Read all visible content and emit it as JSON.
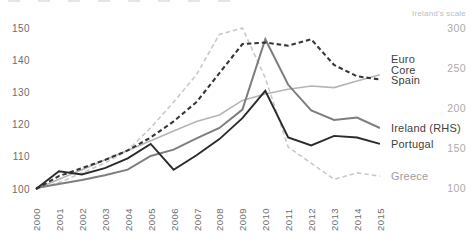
{
  "chart_data": {
    "type": "line",
    "title": "",
    "grid": false,
    "legend_position": "right",
    "x": [
      2000,
      2001,
      2002,
      2003,
      2004,
      2005,
      2006,
      2007,
      2008,
      2009,
      2010,
      2011,
      2012,
      2013,
      2014,
      2015
    ],
    "left_axis": {
      "ticks": [
        150,
        140,
        130,
        120,
        110,
        100
      ],
      "range": [
        100,
        150
      ]
    },
    "right_axis": {
      "title": "Ireland's scale",
      "ticks": [
        300,
        250,
        200,
        150,
        100
      ],
      "range": [
        100,
        300
      ]
    },
    "series": [
      {
        "name": "Euro Core",
        "label_lines": [
          "Euro",
          "Core"
        ],
        "axis": "left",
        "style": "solid",
        "color": "#b5b5b5",
        "label_color": "#3f3f3f",
        "width": 1.6,
        "values": [
          100,
          103,
          106,
          109,
          112,
          115,
          118,
          121,
          123,
          127.5,
          129.5,
          131,
          132,
          131.5,
          133.5,
          135.5
        ]
      },
      {
        "name": "Greece",
        "axis": "left",
        "style": "dashed",
        "color": "#c9c9c9",
        "label_color": "#9e9e9e",
        "width": 1.6,
        "values": [
          100,
          102,
          105,
          108,
          112,
          119,
          127,
          135.5,
          148,
          150,
          134.5,
          113,
          108,
          103,
          105,
          104
        ]
      },
      {
        "name": "Ireland (RHS)",
        "axis": "right",
        "style": "solid",
        "color": "#7e7e7e",
        "label_color": "#3f3f3f",
        "width": 2,
        "values": [
          100,
          105,
          110,
          116,
          123,
          140,
          148,
          162,
          175,
          198,
          286,
          229,
          197,
          185,
          188,
          175
        ]
      },
      {
        "name": "Spain",
        "axis": "left",
        "style": "dashed",
        "color": "#363636",
        "label_color": "#3f3f3f",
        "width": 2.1,
        "values": [
          100,
          104,
          106.5,
          109,
          112,
          116,
          121,
          127,
          136,
          145,
          145.5,
          144.5,
          146.5,
          138.5,
          135,
          134
        ]
      },
      {
        "name": "Portugal",
        "axis": "left",
        "style": "solid",
        "color": "#2b2b2b",
        "label_color": "#3f3f3f",
        "width": 1.9,
        "values": [
          100,
          105.5,
          104.5,
          106.5,
          109.5,
          114,
          106,
          110.5,
          115.5,
          122,
          130.5,
          116,
          113.5,
          116.5,
          116,
          114
        ]
      }
    ]
  }
}
